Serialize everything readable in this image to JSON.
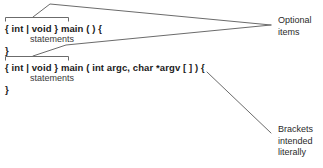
{
  "diagram": {
    "line_color": "#6b6b6b",
    "text_color": "#1a1a1a",
    "background": "#ffffff"
  },
  "code_blocks": [
    {
      "id": "block-1",
      "optional_part": "{ int | void }",
      "signature": "{ int | void } main ( ) {",
      "statements": "statements",
      "closing_brace": "}"
    },
    {
      "id": "block-2",
      "optional_part": "{ int | void }",
      "signature": "{ int | void } main ( int argc, char *argv [ ] ) {",
      "statements": "statements",
      "closing_brace": "}"
    }
  ],
  "annotations": [
    {
      "id": "optional-items",
      "text": "Optional\nitems",
      "points_to": [
        "block-1 optional braces",
        "block-2 optional braces"
      ]
    },
    {
      "id": "brackets-literally",
      "text": "Brackets\nintended\nliterally",
      "points_to": [
        "block-2 argv square brackets"
      ]
    }
  ]
}
